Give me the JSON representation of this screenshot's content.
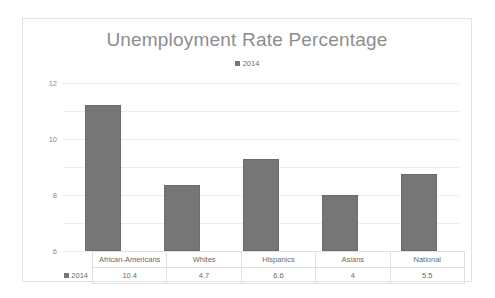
{
  "chart_data": {
    "type": "bar",
    "title": "Unemployment Rate Percentage",
    "xlabel": "",
    "ylabel": "",
    "ylim": [
      0,
      12
    ],
    "yticks": [
      "12",
      "10",
      "8",
      "6",
      "4",
      "2",
      "0"
    ],
    "grid": true,
    "legend_position": "top",
    "categories": [
      "African-Americans",
      "Whites",
      "Hispanics",
      "Asians",
      "National"
    ],
    "series": [
      {
        "name": "2014",
        "color": "#767676",
        "values": [
          10.4,
          4.7,
          6.6,
          4,
          5.5
        ],
        "value_labels": [
          "10.4",
          "4.7",
          "6.6",
          "4",
          "5.5"
        ]
      }
    ],
    "data_table_row_label": "2014"
  },
  "legend": {
    "marker_name": "legend-square-marker",
    "label": "2014"
  }
}
